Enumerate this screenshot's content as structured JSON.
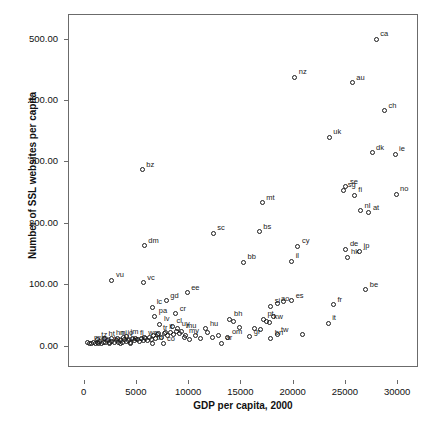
{
  "chart_data": {
    "type": "scatter",
    "title": "",
    "xlabel": "GDP per capita, 2000",
    "ylabel": "Number of SSL websites per capita",
    "xlim": [
      -1500,
      32000
    ],
    "ylim": [
      -35,
      540
    ],
    "xticks": [
      0,
      5000,
      10000,
      15000,
      20000,
      25000,
      30000
    ],
    "xticklabels": [
      "0",
      "5000",
      "10000",
      "15000",
      "20000",
      "25000",
      "30000"
    ],
    "yticks": [
      0,
      100,
      200,
      300,
      400,
      500
    ],
    "yticklabels": [
      "0.00",
      "100.00",
      "200.00",
      "300.00",
      "400.00",
      "500.00"
    ],
    "grid": false,
    "legend": "none",
    "marker": "open-circle",
    "point_label_position": "upper-right",
    "points": [
      {
        "label": "ca",
        "x": 28100,
        "y": 497
      },
      {
        "label": "nz",
        "x": 20300,
        "y": 435
      },
      {
        "label": "au",
        "x": 25800,
        "y": 426
      },
      {
        "label": "ch",
        "x": 28900,
        "y": 381
      },
      {
        "label": "uk",
        "x": 23600,
        "y": 338
      },
      {
        "label": "dk",
        "x": 27700,
        "y": 312
      },
      {
        "label": "ie",
        "x": 29900,
        "y": 310
      },
      {
        "label": "bz",
        "x": 5700,
        "y": 285
      },
      {
        "label": "se",
        "x": 25200,
        "y": 257
      },
      {
        "label": "sg",
        "x": 25000,
        "y": 251
      },
      {
        "label": "no",
        "x": 30000,
        "y": 245
      },
      {
        "label": "fi",
        "x": 26000,
        "y": 243
      },
      {
        "label": "mt",
        "x": 17200,
        "y": 231
      },
      {
        "label": "nl",
        "x": 26600,
        "y": 218
      },
      {
        "label": "at",
        "x": 27400,
        "y": 215
      },
      {
        "label": "bs",
        "x": 16900,
        "y": 184
      },
      {
        "label": "sc",
        "x": 12500,
        "y": 181
      },
      {
        "label": "dm",
        "x": 5900,
        "y": 161
      },
      {
        "label": "cy",
        "x": 20600,
        "y": 160
      },
      {
        "label": "de",
        "x": 25200,
        "y": 155
      },
      {
        "label": "jp",
        "x": 26500,
        "y": 152
      },
      {
        "label": "hk",
        "x": 25300,
        "y": 142
      },
      {
        "label": "il",
        "x": 20000,
        "y": 136
      },
      {
        "label": "bb",
        "x": 15400,
        "y": 134
      },
      {
        "label": "vu",
        "x": 2800,
        "y": 105
      },
      {
        "label": "vc",
        "x": 5800,
        "y": 101
      },
      {
        "label": "be",
        "x": 27100,
        "y": 89
      },
      {
        "label": "ee",
        "x": 10000,
        "y": 84
      },
      {
        "label": "gd",
        "x": 8000,
        "y": 71
      },
      {
        "label": "es",
        "x": 20000,
        "y": 71
      },
      {
        "label": "ao",
        "x": 18600,
        "y": 66
      },
      {
        "label": "fr",
        "x": 24000,
        "y": 65
      },
      {
        "label": "si",
        "x": 18000,
        "y": 62
      },
      {
        "label": "lc",
        "x": 6700,
        "y": 61
      },
      {
        "label": "cr",
        "x": 8900,
        "y": 50
      },
      {
        "label": "pa",
        "x": 6900,
        "y": 46
      },
      {
        "label": "bh",
        "x": 14100,
        "y": 41
      },
      {
        "label": "pt",
        "x": 17300,
        "y": 41
      },
      {
        "label": "kw",
        "x": 17900,
        "y": 36
      },
      {
        "label": "it",
        "x": 23500,
        "y": 35
      },
      {
        "label": "lv",
        "x": 7400,
        "y": 33
      },
      {
        "label": "cl",
        "x": 8600,
        "y": 30
      },
      {
        "label": "uy",
        "x": 9100,
        "y": 26
      },
      {
        "label": "hu",
        "x": 11800,
        "y": 26
      },
      {
        "label": "mu",
        "x": 9500,
        "y": 22
      },
      {
        "label": "lt",
        "x": 7900,
        "y": 20
      },
      {
        "label": "tr",
        "x": 7300,
        "y": 18
      },
      {
        "label": "tw",
        "x": 18600,
        "y": 16
      },
      {
        "label": "my",
        "x": 9800,
        "y": 14
      },
      {
        "label": "gr",
        "x": 16000,
        "y": 13
      },
      {
        "label": "om",
        "x": 13900,
        "y": 12
      },
      {
        "label": "bn",
        "x": 18000,
        "y": 10
      },
      {
        "label": "ws",
        "x": 5900,
        "y": 11
      },
      {
        "label": "fj",
        "x": 5100,
        "y": 10
      },
      {
        "label": "jm",
        "x": 4200,
        "y": 13
      },
      {
        "label": "jo",
        "x": 3900,
        "y": 11
      },
      {
        "label": "ni",
        "x": 3300,
        "y": 10
      },
      {
        "label": "hn",
        "x": 2800,
        "y": 10
      },
      {
        "label": "ht",
        "x": 2100,
        "y": 9
      },
      {
        "label": "tz",
        "x": 1400,
        "y": 8
      },
      {
        "label": "mw",
        "x": 700,
        "y": 2
      },
      {
        "label": "np",
        "x": 1500,
        "y": 1
      },
      {
        "label": "bo",
        "x": 2600,
        "y": 1
      },
      {
        "label": "mn",
        "x": 3600,
        "y": 1
      },
      {
        "label": "ec",
        "x": 4600,
        "y": 1
      },
      {
        "label": "th",
        "x": 6700,
        "y": 2
      },
      {
        "label": "co",
        "x": 7700,
        "y": 1
      },
      {
        "label": "ar",
        "x": 13300,
        "y": 2
      }
    ],
    "cluster_points": [
      {
        "x": 500,
        "y": 3
      },
      {
        "x": 800,
        "y": 2
      },
      {
        "x": 1000,
        "y": 4
      },
      {
        "x": 1200,
        "y": 2
      },
      {
        "x": 1400,
        "y": 3
      },
      {
        "x": 1600,
        "y": 5
      },
      {
        "x": 1800,
        "y": 2
      },
      {
        "x": 2000,
        "y": 4
      },
      {
        "x": 2200,
        "y": 3
      },
      {
        "x": 2400,
        "y": 6
      },
      {
        "x": 2600,
        "y": 3
      },
      {
        "x": 2800,
        "y": 5
      },
      {
        "x": 3000,
        "y": 3
      },
      {
        "x": 3200,
        "y": 7
      },
      {
        "x": 3400,
        "y": 4
      },
      {
        "x": 3600,
        "y": 6
      },
      {
        "x": 3800,
        "y": 4
      },
      {
        "x": 4000,
        "y": 8
      },
      {
        "x": 4200,
        "y": 5
      },
      {
        "x": 4400,
        "y": 7
      },
      {
        "x": 4600,
        "y": 4
      },
      {
        "x": 4800,
        "y": 9
      },
      {
        "x": 5000,
        "y": 6
      },
      {
        "x": 5200,
        "y": 8
      },
      {
        "x": 5400,
        "y": 5
      },
      {
        "x": 5600,
        "y": 10
      },
      {
        "x": 5800,
        "y": 7
      },
      {
        "x": 6000,
        "y": 9
      },
      {
        "x": 6200,
        "y": 6
      },
      {
        "x": 6400,
        "y": 12
      },
      {
        "x": 6600,
        "y": 8
      },
      {
        "x": 6800,
        "y": 14
      },
      {
        "x": 7000,
        "y": 10
      },
      {
        "x": 7200,
        "y": 16
      },
      {
        "x": 7500,
        "y": 12
      },
      {
        "x": 7800,
        "y": 18
      },
      {
        "x": 8100,
        "y": 14
      },
      {
        "x": 8400,
        "y": 20
      },
      {
        "x": 8700,
        "y": 16
      },
      {
        "x": 9000,
        "y": 22
      },
      {
        "x": 9300,
        "y": 18
      },
      {
        "x": 9700,
        "y": 12
      },
      {
        "x": 10200,
        "y": 8
      },
      {
        "x": 10800,
        "y": 14
      },
      {
        "x": 11300,
        "y": 10
      },
      {
        "x": 11900,
        "y": 19
      },
      {
        "x": 12400,
        "y": 11
      },
      {
        "x": 13000,
        "y": 15
      },
      {
        "x": 14400,
        "y": 38
      },
      {
        "x": 15000,
        "y": 28
      },
      {
        "x": 16400,
        "y": 26
      },
      {
        "x": 17000,
        "y": 24
      },
      {
        "x": 17600,
        "y": 38
      },
      {
        "x": 18300,
        "y": 46
      },
      {
        "x": 19200,
        "y": 70
      },
      {
        "x": 21000,
        "y": 16
      }
    ]
  }
}
